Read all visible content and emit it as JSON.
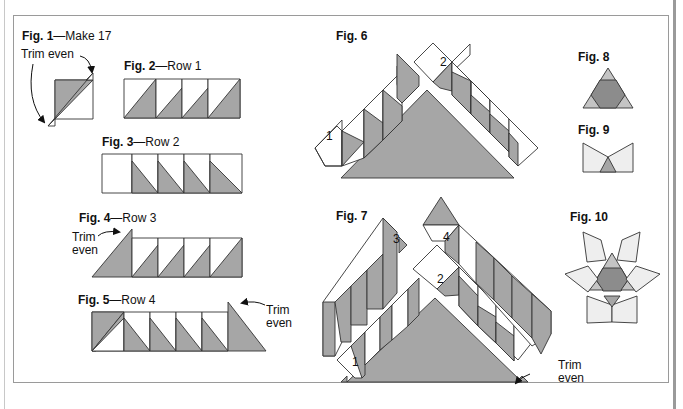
{
  "colors": {
    "fabric_dark": "#a6a6a6",
    "fabric_darker": "#8c8c8c",
    "fabric_light": "#dedede",
    "fabric_lightest": "#eeeeee",
    "fabric_white": "#ffffff",
    "outline": "#333333",
    "frame": "#9a9a9a"
  },
  "figures": [
    {
      "id": "fig1",
      "label": "Fig. 1",
      "caption": "—Make 17",
      "notes": [
        "Trim even"
      ]
    },
    {
      "id": "fig2",
      "label": "Fig. 2",
      "caption": "—Row 1"
    },
    {
      "id": "fig3",
      "label": "Fig. 3",
      "caption": "—Row 2"
    },
    {
      "id": "fig4",
      "label": "Fig. 4",
      "caption": "—Row 3",
      "notes": [
        "Trim",
        "even"
      ]
    },
    {
      "id": "fig5",
      "label": "Fig. 5",
      "caption": "—Row 4",
      "notes": [
        "Trim",
        "even"
      ]
    },
    {
      "id": "fig6",
      "label": "Fig. 6",
      "caption": "",
      "row_numbers": [
        "1",
        "2"
      ]
    },
    {
      "id": "fig7",
      "label": "Fig. 7",
      "caption": "",
      "row_numbers": [
        "1",
        "2",
        "3",
        "4"
      ],
      "notes": [
        "Trim",
        "even"
      ]
    },
    {
      "id": "fig8",
      "label": "Fig. 8",
      "caption": ""
    },
    {
      "id": "fig9",
      "label": "Fig. 9",
      "caption": ""
    },
    {
      "id": "fig10",
      "label": "Fig. 10",
      "caption": ""
    }
  ]
}
